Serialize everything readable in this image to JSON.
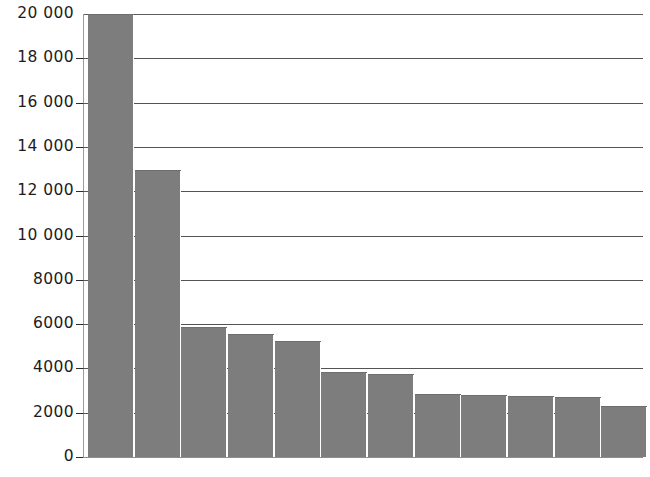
{
  "chart_data": {
    "type": "bar",
    "title": "",
    "subtitle": "",
    "xlabel": "",
    "ylabel": "",
    "categories": [
      "1",
      "2",
      "3",
      "4",
      "5",
      "6",
      "7",
      "8",
      "9",
      "10",
      "11",
      "12"
    ],
    "values": [
      20000,
      12950,
      5850,
      5550,
      5250,
      3850,
      3750,
      2850,
      2800,
      2750,
      2700,
      2300
    ],
    "ylim": [
      0,
      20000
    ],
    "ytick_values": [
      0,
      2000,
      4000,
      6000,
      8000,
      10000,
      12000,
      14000,
      16000,
      18000,
      20000
    ],
    "ytick_labels": [
      "0",
      "2000",
      "4000",
      "6000",
      "8000",
      "10 000",
      "12 000",
      "14 000",
      "16 000",
      "18 000",
      "20 000"
    ],
    "xtick_labels": [],
    "grid": true,
    "grid_axis": "y",
    "legend": false,
    "legend_position": "none",
    "bar_color": "#7d7d7d",
    "gridline_color": "#545454",
    "axis_color": "#8d8d8d",
    "text_color": "#1c1c1c",
    "background_color": "#ffffff",
    "annotations": []
  }
}
